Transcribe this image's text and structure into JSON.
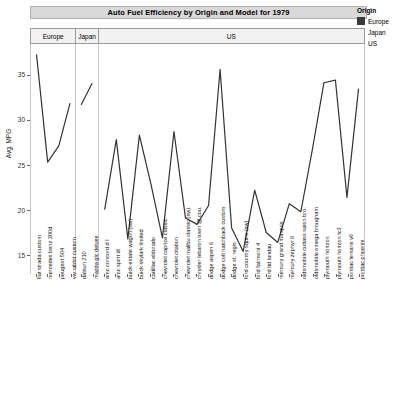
{
  "title": "Auto Fuel Efficiency  by Origin and Model for 1979",
  "legend": {
    "title": "Origin",
    "items": [
      {
        "label": "Europe",
        "color": "#3a3a3a"
      },
      {
        "label": "Japan",
        "color": "#606060"
      },
      {
        "label": "US",
        "color": "#7a7a7a"
      }
    ]
  },
  "axes": {
    "ylabel": "Avg. MPG",
    "yticks": [
      "15",
      "20",
      "25",
      "30",
      "35"
    ],
    "ylim": [
      13.0,
      38.5
    ],
    "grid": false
  },
  "chart_data": {
    "type": "line",
    "title": "Auto Fuel Efficiency  by Origin and Model for 1979",
    "xlabel": "",
    "ylabel": "Avg. MPG",
    "ylim": [
      13.0,
      38.5
    ],
    "yticks": [
      15,
      20,
      25,
      30,
      35
    ],
    "grid": false,
    "legend_position": "right",
    "facet_by": "Origin",
    "panels": [
      {
        "name": "Europe",
        "color": "#3a3a3a",
        "categories": [
          "fiat strada custom",
          "mercedes benz 300d",
          "peugeot 504",
          "vw rabbit custom"
        ],
        "values": [
          37.3,
          25.4,
          27.2,
          31.9
        ]
      },
      {
        "name": "Japan",
        "color": "#606060",
        "categories": [
          "datsun 210",
          "mazda glc deluxe"
        ],
        "values": [
          31.8,
          34.1
        ]
      },
      {
        "name": "US",
        "color": "#7a7a7a",
        "categories": [
          "amc concord d l",
          "amc spirit dl",
          "buick estate wagon (sw)",
          "buick skylark limited",
          "cadillac eldorado",
          "chevrolet caprice classic",
          "chevrolet citation",
          "chevrolet malibu classic (sw)",
          "chrysler lebaron town @ cou.",
          "dodge aspen 6",
          "dodge colt hatchback custom",
          "dodge st. regis",
          "ford country squire (sw)",
          "ford fairmont 4",
          "ford ltd landau",
          "mercury grand marquis",
          "mercury zephyr 6",
          "oldsmobile cutlass salon bro.",
          "oldsmobile omega brougham",
          "plymouth horizon",
          "plymouth horizon tc3",
          "pontiac lemans v6",
          "pontiac phoenix"
        ],
        "values": [
          20.2,
          27.9,
          16.9,
          28.4,
          23.0,
          17.0,
          28.8,
          19.2,
          18.5,
          20.6,
          35.7,
          18.1,
          15.5,
          22.3,
          17.6,
          16.5,
          20.8,
          19.9,
          26.8,
          34.2,
          34.5,
          21.5,
          33.5
        ]
      }
    ]
  },
  "panel_headers": [
    "Europe",
    "Japan",
    "US"
  ]
}
